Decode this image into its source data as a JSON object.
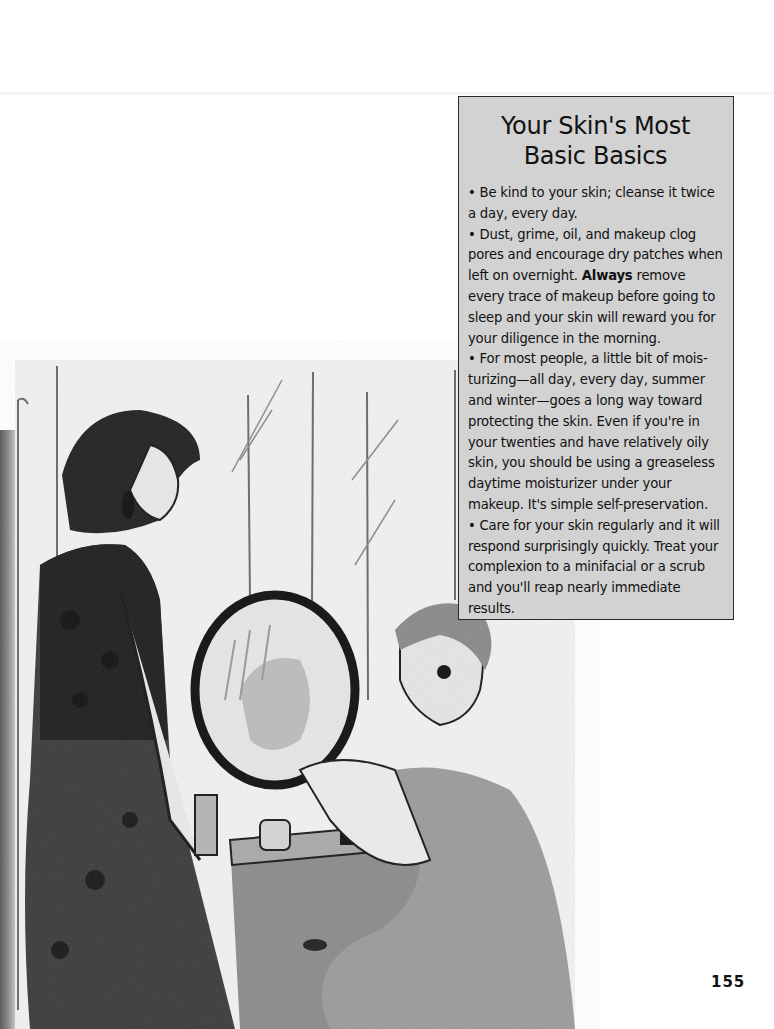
{
  "sidebar": {
    "title": "Your Skin's Most Basic Basics",
    "bullet_glyph": "•",
    "items": [
      {
        "text": "Be kind to your skin; cleanse it twice a day, every day."
      },
      {
        "text_before": "Dust, grime, oil, and makeup clog pores and encourage dry patches when left on overnight. ",
        "bold": "Always",
        "text_after": " remove every trace of makeup before going to sleep and your skin will reward you for your diligence in the morning."
      },
      {
        "text": "For most people, a little bit of mois-turizing—all day, every day, summer and winter—goes a long way toward protecting the skin. Even if you're in your twenties and have relatively oily skin, you should be using a greaseless daytime moisturizer under your makeup. It's simple self-preservation."
      },
      {
        "text": "Care for your skin regularly and it will respond surprisingly quickly. Treat your complexion to a minifacial or a scrub and you'll reap nearly immediate results."
      }
    ]
  },
  "illustration": {
    "description": "Pencil sketch of two women at a vanity table with a round mirror; one standing in a dark patterned dress, one seated applying makeup",
    "colors": {
      "ink": "#1a1a1a",
      "mid": "#7a7a7a",
      "light": "#bdbdbd",
      "paper": "#f2f2f2"
    }
  },
  "footer": {
    "page_number": "155"
  },
  "colors": {
    "box_fill": "#d2d2d2",
    "box_border": "#2a2a2a",
    "text": "#111111"
  }
}
